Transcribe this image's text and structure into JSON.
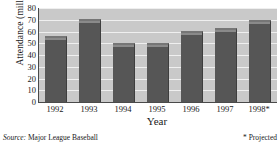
{
  "chart_data": {
    "type": "bar",
    "title": "",
    "categories": [
      "1992",
      "1993",
      "1994",
      "1995",
      "1996",
      "1997",
      "1998*"
    ],
    "values": [
      56,
      70.5,
      50,
      50.5,
      60.5,
      63,
      70
    ],
    "xlabel": "Year",
    "ylabel": "Attendance (millions)",
    "ylim": [
      0,
      80
    ],
    "yticks": [
      0,
      10,
      20,
      30,
      40,
      50,
      60,
      70,
      80
    ],
    "ytick_labels": [
      "0",
      "10",
      "20",
      "30",
      "40",
      "50",
      "60",
      "70",
      "80"
    ],
    "grid": true,
    "legend": "none",
    "series_color": "#565656",
    "plot_background": "#c9c9c9",
    "gridline_color": "#efefef"
  },
  "footer": {
    "source_label": "Source:",
    "source_value": "Major League Baseball",
    "projected_note": "* Projected"
  }
}
